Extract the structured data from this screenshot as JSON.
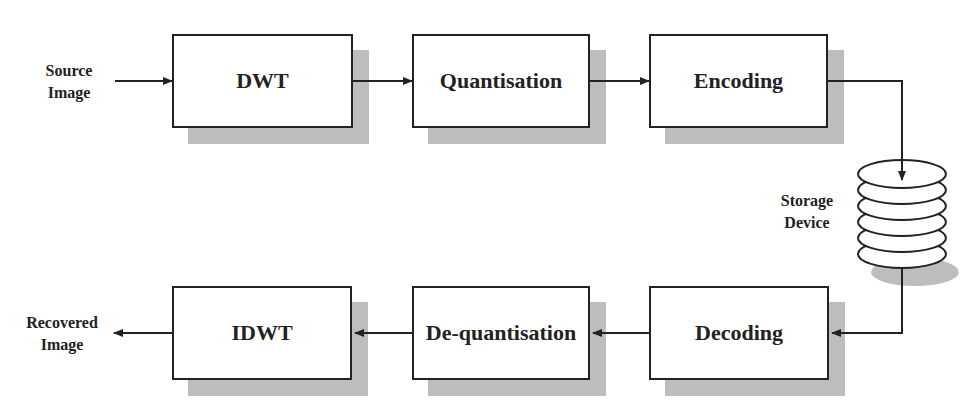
{
  "diagram": {
    "title": "",
    "inputs": {
      "source": {
        "line1": "Source",
        "line2": "Image"
      },
      "recovered": {
        "line1": "Recovered",
        "line2": "Image"
      },
      "storage": {
        "line1": "Storage",
        "line2": "Device"
      }
    },
    "top_row": [
      {
        "id": "dwt",
        "label": "DWT"
      },
      {
        "id": "quantisation",
        "label": "Quantisation"
      },
      {
        "id": "encoding",
        "label": "Encoding"
      }
    ],
    "bottom_row": [
      {
        "id": "idwt",
        "label": "IDWT"
      },
      {
        "id": "dequantisation",
        "label": "De-quantisation"
      },
      {
        "id": "decoding",
        "label": "Decoding"
      }
    ],
    "edges": [
      {
        "from": "Source Image",
        "to": "DWT"
      },
      {
        "from": "DWT",
        "to": "Quantisation"
      },
      {
        "from": "Quantisation",
        "to": "Encoding"
      },
      {
        "from": "Encoding",
        "to": "Storage Device"
      },
      {
        "from": "Storage Device",
        "to": "Decoding"
      },
      {
        "from": "Decoding",
        "to": "De-quantisation"
      },
      {
        "from": "De-quantisation",
        "to": "IDWT"
      },
      {
        "from": "IDWT",
        "to": "Recovered Image"
      }
    ],
    "colors": {
      "stroke": "#222222",
      "shadow": "#bdbdbd",
      "fill": "#ffffff"
    }
  }
}
